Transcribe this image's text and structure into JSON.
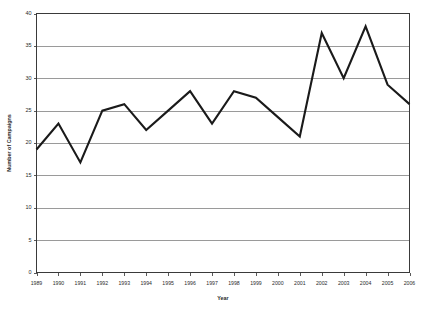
{
  "chart_data": {
    "type": "line",
    "title": "",
    "xlabel": "Year",
    "ylabel": "Number of Campaigns",
    "categories": [
      "1989",
      "1990",
      "1991",
      "1992",
      "1993",
      "1994",
      "1995",
      "1996",
      "1997",
      "1998",
      "1999",
      "2000",
      "2001",
      "2002",
      "2003",
      "2004",
      "2005",
      "2006"
    ],
    "values": [
      19,
      23,
      17,
      25,
      26,
      22,
      25,
      28,
      23,
      28,
      27,
      24,
      21,
      37,
      30,
      38,
      29,
      26
    ],
    "series": [
      {
        "name": "Number of Campaigns",
        "values": [
          19,
          23,
          17,
          25,
          26,
          22,
          25,
          28,
          23,
          28,
          27,
          24,
          21,
          37,
          30,
          38,
          29,
          26
        ]
      }
    ],
    "ylim": [
      0,
      40
    ],
    "ytick_labels": [
      "0",
      "5",
      "10",
      "15",
      "20",
      "25",
      "30",
      "35",
      "40"
    ],
    "ytick_values": [
      0,
      5,
      10,
      15,
      20,
      25,
      30,
      35,
      40
    ],
    "xtick_labels": [
      "1989",
      "1990",
      "1991",
      "1992",
      "1993",
      "1994",
      "1995",
      "1996",
      "1997",
      "1998",
      "1999",
      "2000",
      "2001",
      "2002",
      "2003",
      "2004",
      "2005",
      "2006"
    ],
    "grid": "horizontal",
    "legend": "none",
    "line_color": "#1a1a1a",
    "grid_color": "#9a9a9a",
    "axis_color": "#3a3a3a"
  }
}
